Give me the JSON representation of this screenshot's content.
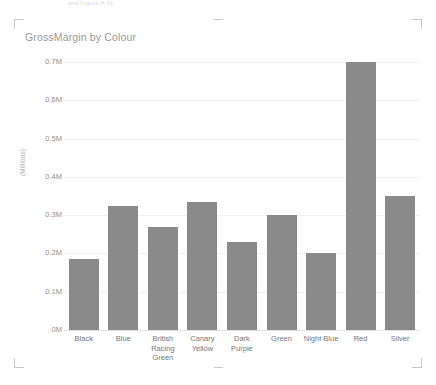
{
  "artifact": {
    "top_text": "and Figure 4-41"
  },
  "chart": {
    "title": "GrossMargin by Colour",
    "bar_color": "#8a8a8a",
    "text_color": "#8f8f8f",
    "gridline_color": "#f0f0f0"
  },
  "selection": {
    "corner_tl": "corner-bracket-top-left",
    "corner_tr": "corner-bracket-top-right",
    "corner_bl": "corner-bracket-bottom-left",
    "corner_br": "corner-bracket-bottom-right",
    "handle_top": "edge-handle-top",
    "handle_bottom": "edge-handle-bottom"
  },
  "chart_data": {
    "type": "bar",
    "title": "GrossMargin by Colour",
    "xlabel": "",
    "ylabel": "(Millions)",
    "categories": [
      "Black",
      "Blue",
      "British Racing Green",
      "Canary Yellow",
      "Dark Purple",
      "Green",
      "Night Blue",
      "Red",
      "Silver"
    ],
    "values": [
      0.185,
      0.325,
      0.27,
      0.335,
      0.23,
      0.3,
      0.2,
      0.7,
      0.35
    ],
    "ylim": [
      0,
      0.7
    ],
    "ytick_values": [
      0,
      0.1,
      0.2,
      0.3,
      0.4,
      0.5,
      0.6,
      0.7
    ],
    "ytick_labels": [
      "0M",
      "0.1M",
      "0.2M",
      "0.3M",
      "0.4M",
      "0.5M",
      "0.6M",
      "0.7M"
    ],
    "grid": true,
    "legend": false,
    "legend_position": "none"
  }
}
